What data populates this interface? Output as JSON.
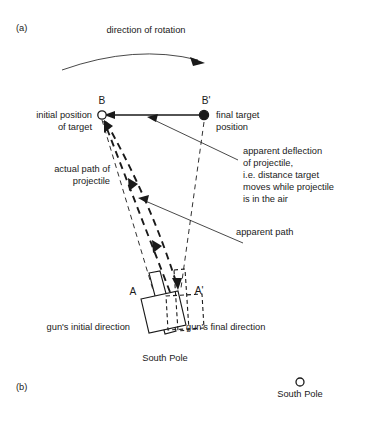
{
  "figure": {
    "panel_a_label": "(a)",
    "panel_b_label": "(b)",
    "rotation_label": "direction of rotation",
    "points": {
      "B": "B",
      "B_prime": "B'",
      "A": "A",
      "A_prime": "A'"
    },
    "labels": {
      "initial_position_line1": "initial position",
      "initial_position_line2": "of target",
      "final_target_line1": "final target",
      "final_target_line2": "position",
      "actual_path_line1": "actual path of",
      "actual_path_line2": "projectile",
      "deflection_line1": "apparent deflection",
      "deflection_line2": "of projectile,",
      "deflection_line3": "i.e. distance target",
      "deflection_line4": "moves while projectile",
      "deflection_line5": "is in the air",
      "apparent_path": "apparent path",
      "gun_initial_direction": "gun's initial direction",
      "gun_final_direction": "gun's final direction",
      "south_pole_a": "South Pole",
      "south_pole_b": "South Pole"
    },
    "icons": {
      "rotation_arc": "curved-arrow-icon",
      "target_initial_marker": "open-circle-marker-icon",
      "target_final_marker": "filled-circle-marker-icon",
      "south_pole_marker_b": "open-circle-marker-icon"
    },
    "colors": {
      "background": "#ffffff",
      "ink": "#1a1a1a"
    }
  }
}
